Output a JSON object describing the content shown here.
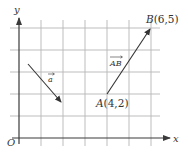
{
  "diagram": {
    "axes": {
      "x_label": "x",
      "y_label": "y",
      "origin_label": "O"
    },
    "grid": {
      "origin_px": [
        19,
        138
      ],
      "spacing_px": 22,
      "x_units": 6,
      "y_units": 5
    },
    "points": [
      {
        "name": "A",
        "coords": "(4,2)",
        "label": "A(4,2)",
        "x": 4,
        "y": 2
      },
      {
        "name": "B",
        "coords": "(6,5)",
        "label": "B(6,5)",
        "x": 6,
        "y": 5
      }
    ],
    "vectors": [
      {
        "name": "a",
        "label": "a",
        "from": [
          0.4,
          3.4
        ],
        "to": [
          1.9,
          1.6
        ]
      },
      {
        "name": "AB",
        "label": "AB",
        "from": "A",
        "to": "B"
      }
    ],
    "colors": {
      "grid": "#b5b5b5",
      "axis": "#3a3a3a",
      "vector": "#333333",
      "background": "#ffffff"
    }
  }
}
